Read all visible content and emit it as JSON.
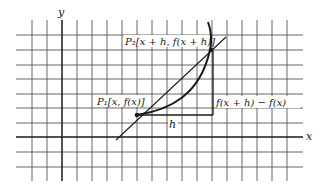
{
  "diagram": {
    "axes": {
      "x_label": "x",
      "y_label": "y"
    },
    "points": {
      "p1": {
        "label": "P₁[x, f(x)]"
      },
      "p2": {
        "label": "P₂[x + h, f(x + h)]"
      }
    },
    "annotations": {
      "h_label": "h",
      "rise_label": "f(x + h) − f(x)"
    },
    "colors": {
      "grid": "#555555",
      "axis": "#1a1a1a",
      "curve": "#1a1a1a",
      "background": "#ffffff"
    }
  }
}
